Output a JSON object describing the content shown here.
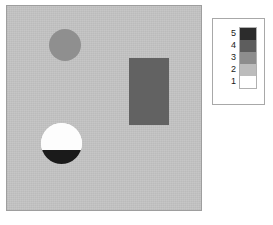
{
  "figure": {
    "type": "labelled-raster-image-with-legend",
    "background_color": "#ffffff"
  },
  "image_panel": {
    "name": "classified-image",
    "background_color": "#c4c4c4",
    "border_color": "#9e9e9e",
    "shapes": [
      {
        "id": "small-circle",
        "kind": "circle",
        "fill": "#8f8f8f",
        "class_value": 3,
        "x": 42,
        "y": 23,
        "diameter": 32
      },
      {
        "id": "rectangle",
        "kind": "rectangle",
        "fill": "#626262",
        "class_value": 4,
        "x": 122,
        "y": 52,
        "width": 40,
        "height": 67
      },
      {
        "id": "split-circle",
        "kind": "circle",
        "fill_top": "#fdfdfd",
        "fill_bottom": "#1a1a1a",
        "class_value_top": 1,
        "class_value_bottom": 5,
        "x": 34,
        "y": 117,
        "diameter": 41
      }
    ]
  },
  "legend": {
    "name": "class-legend",
    "border_color": "#a8a8a8",
    "background_color": "#ffffff",
    "entries": [
      {
        "label": "5",
        "color": "#2c2c2c"
      },
      {
        "label": "4",
        "color": "#5d5d5d"
      },
      {
        "label": "3",
        "color": "#8d8d8d"
      },
      {
        "label": "2",
        "color": "#bcbcbc"
      },
      {
        "label": "1",
        "color": "#ffffff"
      }
    ]
  },
  "chart_data": {
    "type": "heatmap",
    "title": "",
    "subtitle": "",
    "xlabel": "",
    "ylabel": "",
    "grid": false,
    "legend_position": "right",
    "colorbar_type": "discrete",
    "categories": [
      "1",
      "2",
      "3",
      "4",
      "5"
    ],
    "colors": [
      "#ffffff",
      "#bcbcbc",
      "#8d8d8d",
      "#5d5d5d",
      "#2c2c2c"
    ],
    "tick_labels": [
      "1",
      "2",
      "3",
      "4",
      "5"
    ],
    "values": [
      1,
      2,
      3,
      4,
      5
    ],
    "regions": [
      {
        "name": "background",
        "class": 2,
        "color": "#c4c4c4"
      },
      {
        "name": "small-circle",
        "class": 3,
        "color": "#8f8f8f"
      },
      {
        "name": "rectangle",
        "class": 4,
        "color": "#626262"
      },
      {
        "name": "split-circle-upper",
        "class": 1,
        "color": "#fdfdfd"
      },
      {
        "name": "split-circle-lower",
        "class": 5,
        "color": "#1a1a1a"
      }
    ]
  }
}
